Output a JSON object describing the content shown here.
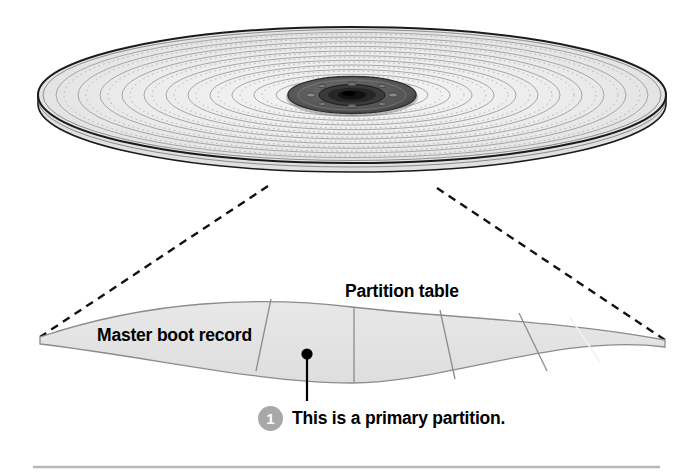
{
  "figure": {
    "title_label": "Partition table",
    "mbr_label": "Master boot record",
    "callout": {
      "number": "1",
      "text": "This is a primary partition."
    },
    "disk": {
      "icon_name": "hard-disk-platter",
      "platter_fill": "#ebebeb",
      "platter_edge": "#1a1a1a",
      "track_color": "#9a9a9a",
      "hub_dark": "#4a4a4a",
      "hub_core": "#1c1c1c",
      "track_count": 12,
      "screw_hole_count": 6
    },
    "band": {
      "icon_name": "partition-band-arc",
      "fill": "#e2e2e2",
      "stroke": "#8c8c8c",
      "segment_count": 6,
      "segments": [
        "Master boot record",
        "primary partition 1",
        "partition 2",
        "partition 3",
        "partition 4",
        "partition 5"
      ]
    },
    "leader_lines": {
      "icon_name": "dashed-zoom-leader",
      "color": "#111111",
      "style": "dashed"
    },
    "pointer": {
      "icon_name": "callout-pointer-line",
      "color": "#000000"
    },
    "footer_rule_color": "#b8b8b8"
  }
}
